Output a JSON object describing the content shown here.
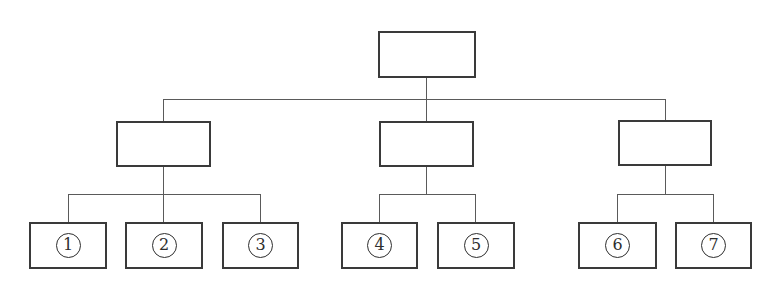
{
  "diagram": {
    "type": "tree",
    "root": {
      "label": ""
    },
    "level2_boxes": [
      {
        "label": ""
      },
      {
        "label": ""
      },
      {
        "label": ""
      }
    ],
    "leaf_boxes": [
      {
        "number": "1",
        "group": 0
      },
      {
        "number": "2",
        "group": 0
      },
      {
        "number": "3",
        "group": 0
      },
      {
        "number": "4",
        "group": 1
      },
      {
        "number": "5",
        "group": 1
      },
      {
        "number": "6",
        "group": 2
      },
      {
        "number": "7",
        "group": 2
      }
    ]
  },
  "colors": {
    "background": "#ffffff",
    "line": "#5a5a5a",
    "box_border": "#3a3a3a",
    "text": "#2e2e2e"
  }
}
